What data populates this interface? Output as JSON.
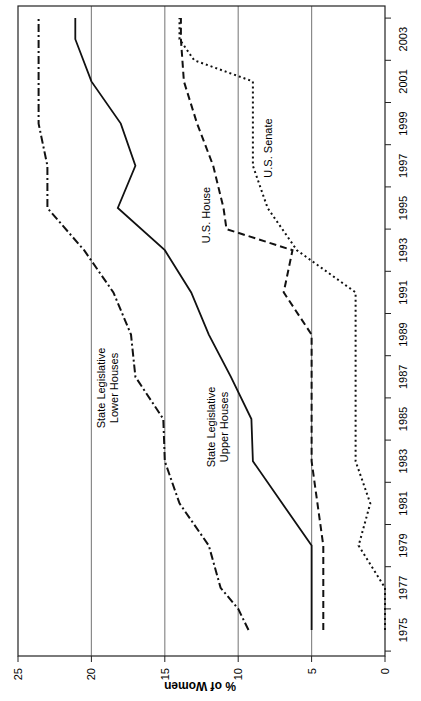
{
  "chart_data": {
    "type": "line",
    "orientation": "rotated 90 degrees clockwise (x-axis runs bottom-to-top on right edge, y-axis runs right-to-left along bottom)",
    "title": "",
    "xlabel": "",
    "ylabel": "% of Women",
    "x_ticks": [
      "1975",
      "1977",
      "1979",
      "1981",
      "1983",
      "1985",
      "1987",
      "1989",
      "1991",
      "1993",
      "1995",
      "1997",
      "1999",
      "2001",
      "2003"
    ],
    "y_ticks": [
      "0",
      "5",
      "10",
      "15",
      "20",
      "25"
    ],
    "xlim": [
      1974,
      2005
    ],
    "ylim": [
      0,
      25
    ],
    "grid": "horizontal gridlines at 5, 10, 15, 20",
    "legend": "inline labels",
    "series": [
      {
        "name": "State Legislative Lower Houses",
        "style": "dash-dot",
        "x": [
          1975,
          1976,
          1977,
          1979,
          1981,
          1983,
          1985,
          1987,
          1989,
          1991,
          1993,
          1995,
          1997,
          1999,
          2004
        ],
        "values": [
          9.3,
          10.0,
          11.2,
          12.0,
          14.0,
          15.0,
          15.1,
          17.0,
          17.3,
          18.5,
          20.5,
          23.0,
          23.0,
          23.6,
          23.6
        ]
      },
      {
        "name": "State Legislative Upper Houses",
        "style": "solid",
        "x": [
          1975,
          1979,
          1983,
          1985,
          1987,
          1989,
          1991,
          1993,
          1995,
          1997,
          1999,
          2001,
          2003,
          2004
        ],
        "values": [
          5.0,
          5.0,
          9.0,
          9.1,
          10.5,
          12.0,
          13.2,
          15.0,
          18.2,
          17.0,
          18.0,
          20.0,
          21.1,
          21.1
        ]
      },
      {
        "name": "U.S. House",
        "style": "dashed",
        "x": [
          1975,
          1979,
          1983,
          1989,
          1991,
          1993,
          1994,
          1995,
          1997,
          1999,
          2001,
          2003,
          2004
        ],
        "values": [
          4.2,
          4.2,
          5.0,
          5.0,
          6.9,
          6.3,
          10.8,
          11.0,
          11.7,
          12.8,
          13.7,
          13.9,
          13.9
        ]
      },
      {
        "name": "U.S. Senate",
        "style": "dotted",
        "x": [
          1975,
          1977,
          1979,
          1981,
          1983,
          1991,
          1993,
          1995,
          1997,
          2001,
          2002,
          2003,
          2004
        ],
        "values": [
          0.0,
          0.0,
          1.8,
          1.0,
          2.0,
          2.0,
          6.0,
          8.0,
          9.0,
          9.0,
          13.0,
          14.0,
          14.0
        ]
      }
    ]
  },
  "labels": {
    "y_axis_title": "% of Women",
    "lower_houses_line1": "State Legislative",
    "lower_houses_line2": "Lower Houses",
    "upper_houses_line1": "State Legislative",
    "upper_houses_line2": "Upper Houses",
    "us_house": "U.S. House",
    "us_senate": "U.S. Senate"
  }
}
